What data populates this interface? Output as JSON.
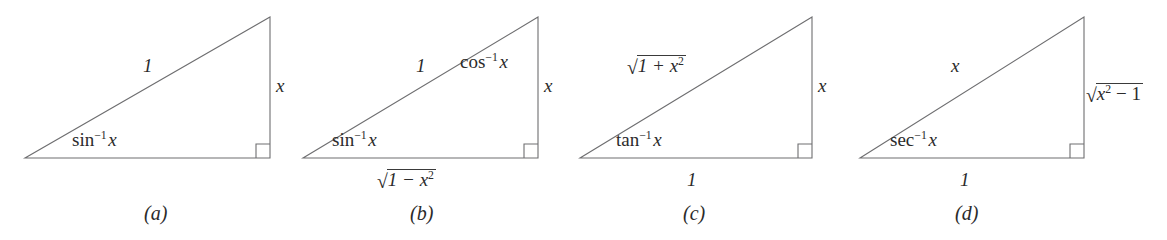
{
  "figure": {
    "background_color": "#ffffff",
    "line_color": "#6e6e70",
    "text_color": "#2b2b2b",
    "width": 1167,
    "height": 240
  },
  "panels": [
    {
      "id": "a",
      "caption": "(a)",
      "hypotenuse_label": "1",
      "opposite_label": "x",
      "adjacent_label": "",
      "base_angle_fn": "sin",
      "base_angle_exp": "−1",
      "base_angle_arg": "x",
      "top_angle_label": ""
    },
    {
      "id": "b",
      "caption": "(b)",
      "hypotenuse_label": "1",
      "opposite_label": "x",
      "adjacent_radicand": "1 − x",
      "adjacent_radicand_exp": "2",
      "base_angle_fn": "sin",
      "base_angle_exp": "−1",
      "base_angle_arg": "x",
      "top_angle_fn": "cos",
      "top_angle_exp": "−1",
      "top_angle_arg": "x"
    },
    {
      "id": "c",
      "caption": "(c)",
      "hypotenuse_radicand": "1 + x",
      "hypotenuse_radicand_exp": "2",
      "opposite_label": "x",
      "adjacent_label": "1",
      "base_angle_fn": "tan",
      "base_angle_exp": "−1",
      "base_angle_arg": "x",
      "top_angle_label": ""
    },
    {
      "id": "d",
      "caption": "(d)",
      "hypotenuse_label": "x",
      "opposite_radicand": "x",
      "opposite_radicand_exp": "2",
      "opposite_radicand_tail": "− 1",
      "adjacent_label": "1",
      "base_angle_fn": "sec",
      "base_angle_exp": "−1",
      "base_angle_arg": "x",
      "top_angle_label": ""
    }
  ]
}
